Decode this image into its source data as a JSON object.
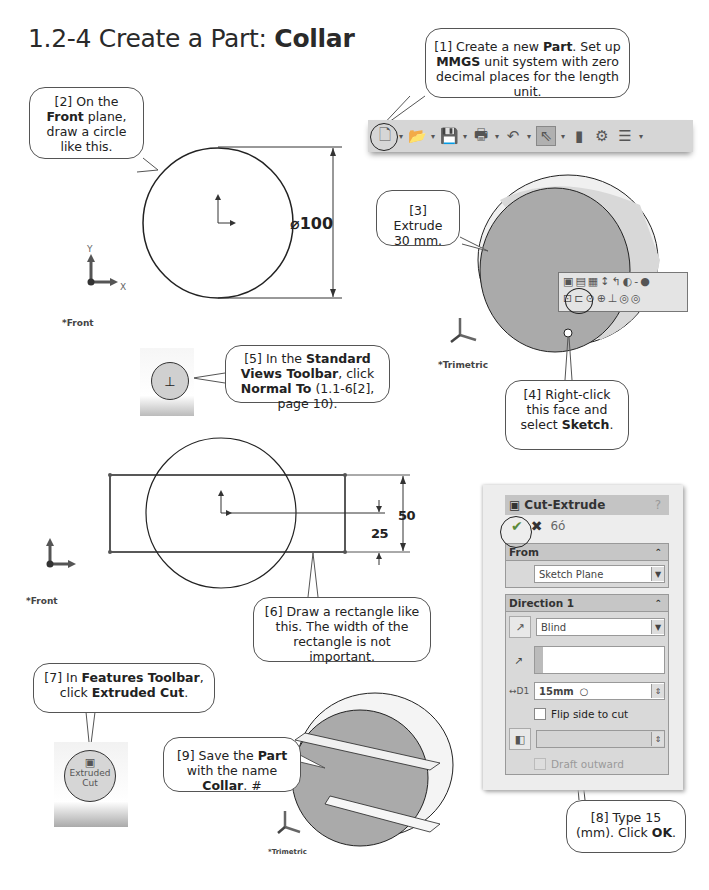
{
  "page": {
    "title_prefix": "1.2-4  Create a Part: ",
    "title_bold": "Collar"
  },
  "steps": {
    "s1": {
      "parts": [
        "[1] Create a new ",
        "Part",
        ".  Set up ",
        "MMGS",
        " unit system with zero decimal places for the length unit."
      ]
    },
    "s2": {
      "parts": [
        "[2] On the ",
        "Front",
        " plane, draw a circle like this."
      ]
    },
    "s3": {
      "text": "[3] Extrude 30 mm."
    },
    "s4": {
      "parts": [
        "[4] Right-click this face and select ",
        "Sketch",
        "."
      ]
    },
    "s5": {
      "parts": [
        "[5] In the ",
        "Standard Views Toolbar",
        ", click ",
        "Normal To",
        " (1.1-6[2], page 10)."
      ]
    },
    "s6": {
      "text": "[6] Draw a rectangle like this. The width of the rectangle is not important."
    },
    "s7": {
      "parts": [
        "[7] In ",
        "Features Toolbar",
        ", click ",
        "Extruded Cut",
        "."
      ]
    },
    "s8": {
      "parts": [
        "[8] Type 15 (mm). Click ",
        "OK",
        "."
      ]
    },
    "s9": {
      "parts": [
        "[9] Save the ",
        "Part",
        " with the name ",
        "Collar",
        ". #"
      ]
    }
  },
  "sketch1": {
    "dimension": "⌀100",
    "view_label": "*Front",
    "axis_x": "X",
    "axis_y": "Y"
  },
  "model1": {
    "view_label": "*Trimetric"
  },
  "sketch2": {
    "dim_height": "50",
    "dim_offset": "25",
    "view_label": "*Front"
  },
  "model2": {
    "view_label": "*Trimetric"
  },
  "toolbar": {
    "icons": [
      "new-document",
      "open-folder",
      "save-disk",
      "print",
      "undo",
      "select-arrow",
      "rebuild-traffic-light",
      "options",
      "file-properties"
    ]
  },
  "features_button": {
    "label_line1": "Extruded",
    "label_line2": "Cut"
  },
  "property_manager": {
    "title": "Cut-Extrude",
    "help": "?",
    "from_section": "From",
    "from_value": "Sketch Plane",
    "direction_section": "Direction 1",
    "end_condition": "Blind",
    "depth_value": "15mm",
    "flip_label": "Flip side to cut",
    "draft_label": "Draft outward"
  }
}
